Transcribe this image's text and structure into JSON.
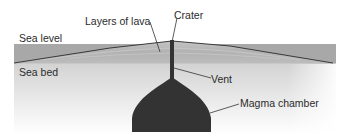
{
  "diagram": {
    "labels": {
      "layers_of_lava": "Layers of lava",
      "crater": "Crater",
      "sea_level": "Sea level",
      "sea_bed": "Sea bed",
      "vent": "Vent",
      "magma_chamber": "Magma chamber"
    },
    "colors": {
      "sea_band": "#a9a9a9",
      "cone": "#bdbdbd",
      "seabed_top": "#d6d6d6",
      "seabed_bottom": "#ffffff",
      "magma": "#333333",
      "leader_line": "#333333",
      "text": "#2b2b2b"
    }
  }
}
